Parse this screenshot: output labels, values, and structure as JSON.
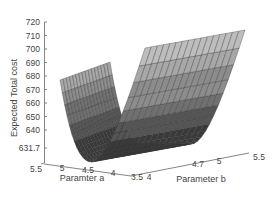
{
  "chart_data": {
    "type": "surface3d",
    "title": "",
    "zlabel": "Expected Total cost",
    "xlabel": "Paramter a",
    "ylabel": "Parameter b",
    "z_ticks": [
      "720",
      "710",
      "700",
      "690",
      "680",
      "670",
      "660",
      "650",
      "640",
      "631.7"
    ],
    "x_ticks": [
      "5.5",
      "5",
      "4.5",
      "4",
      "3.5"
    ],
    "y_ticks": [
      "4",
      "4.7",
      "5",
      "5.5"
    ],
    "zlim": [
      631.7,
      720
    ],
    "xlim": [
      3.5,
      5.5
    ],
    "ylim": [
      4,
      5.5
    ],
    "minimum": {
      "z": 631.7
    },
    "colormap": [
      "#3a3a3a",
      "#555555",
      "#707070",
      "#8c8c8c",
      "#a8a8a8",
      "#bdbdbd"
    ]
  }
}
